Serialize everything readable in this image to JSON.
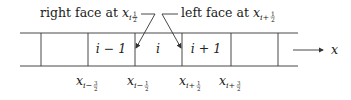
{
  "annotations": {
    "left": {
      "text": "right face at ",
      "var": "x",
      "sub": "i−",
      "frac_num": "1",
      "frac_den": "2"
    },
    "right": {
      "text": "left face at ",
      "var": "x",
      "sub": "i+",
      "frac_num": "1",
      "frac_den": "2"
    }
  },
  "cells": [
    {
      "label": ""
    },
    {
      "label": ""
    },
    {
      "label": "i − 1"
    },
    {
      "label": "i"
    },
    {
      "label": "i + 1"
    },
    {
      "label": ""
    }
  ],
  "axis": {
    "label": "x"
  },
  "face_labels": [
    {
      "var": "x",
      "sub": "i−",
      "num": "3",
      "den": "2"
    },
    {
      "var": "x",
      "sub": "i−",
      "num": "1",
      "den": "2"
    },
    {
      "var": "x",
      "sub": "i+",
      "num": "1",
      "den": "2"
    },
    {
      "var": "x",
      "sub": "i+",
      "num": "3",
      "den": "2"
    }
  ],
  "colors": {
    "stroke": "#333333",
    "text": "#222222"
  }
}
